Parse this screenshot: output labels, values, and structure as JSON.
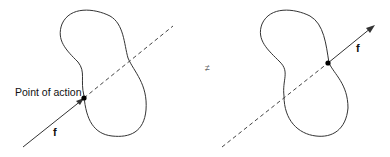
{
  "diagram": {
    "left": {
      "label_point": "Point of action",
      "label_force": "f"
    },
    "relation": "≠",
    "right": {
      "label_force": "f"
    },
    "colors": {
      "stroke": "#333333",
      "dash": "#444444",
      "point": "#000000"
    }
  }
}
